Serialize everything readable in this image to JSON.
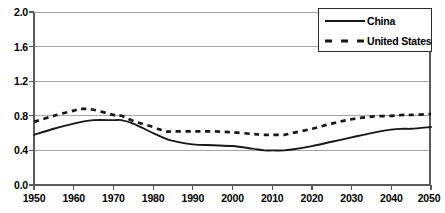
{
  "chart_data": {
    "type": "line",
    "title": "",
    "subtitle": "",
    "xlabel": "",
    "ylabel": "",
    "xlim": [
      1950,
      2050
    ],
    "ylim": [
      0.0,
      2.0
    ],
    "grid": true,
    "legend_position": "upper-right",
    "x_ticks": [
      "1950",
      "1960",
      "1970",
      "1980",
      "1990",
      "2000",
      "2010",
      "2020",
      "2030",
      "2040",
      "2050"
    ],
    "y_ticks": [
      "0.0",
      "0.4",
      "0.8",
      "1.2",
      "1.6",
      "2.0"
    ],
    "x": [
      1950,
      1955,
      1960,
      1962,
      1965,
      1970,
      1972,
      1975,
      1980,
      1983,
      1985,
      1990,
      1995,
      2000,
      2005,
      2008,
      2010,
      2013,
      2015,
      2020,
      2025,
      2030,
      2035,
      2040,
      2043,
      2045,
      2050
    ],
    "series": [
      {
        "name": "China",
        "style": "solid",
        "color": "#171717",
        "values": [
          0.58,
          0.65,
          0.71,
          0.73,
          0.75,
          0.75,
          0.75,
          0.71,
          0.6,
          0.54,
          0.51,
          0.47,
          0.46,
          0.45,
          0.42,
          0.4,
          0.4,
          0.4,
          0.41,
          0.45,
          0.5,
          0.55,
          0.6,
          0.64,
          0.65,
          0.65,
          0.67
        ]
      },
      {
        "name": "United States",
        "style": "dashed",
        "color": "#171717",
        "values": [
          0.73,
          0.8,
          0.86,
          0.88,
          0.87,
          0.81,
          0.8,
          0.74,
          0.67,
          0.62,
          0.62,
          0.62,
          0.62,
          0.61,
          0.59,
          0.58,
          0.58,
          0.58,
          0.6,
          0.65,
          0.71,
          0.76,
          0.79,
          0.8,
          0.81,
          0.81,
          0.82
        ]
      }
    ]
  },
  "legend": {
    "entries": [
      {
        "label": "China",
        "swatch": "solid-line-swatch"
      },
      {
        "label": "United States",
        "swatch": "dashed-line-swatch"
      }
    ]
  },
  "caption": {
    "text": ""
  }
}
